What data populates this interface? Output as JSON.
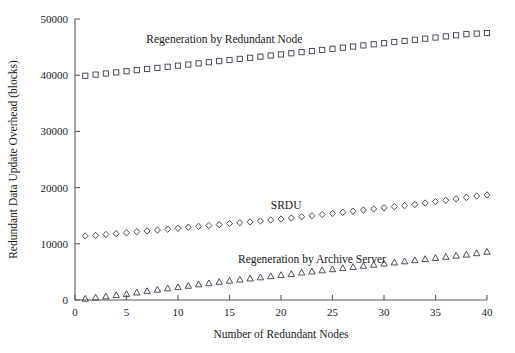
{
  "chart_data": {
    "type": "scatter",
    "title": "",
    "xlabel": "Number of Redundant Nodes",
    "ylabel": "Redundant Data Update Overhead (blocks)",
    "xlim": [
      0,
      40
    ],
    "ylim": [
      0,
      50000
    ],
    "xticks": [
      0,
      5,
      10,
      15,
      20,
      25,
      30,
      35,
      40
    ],
    "xticklabels": [
      "0",
      "5",
      "10",
      "15",
      "20",
      "25",
      "30",
      "35",
      "40"
    ],
    "yticks": [
      0,
      10000,
      20000,
      30000,
      40000,
      50000
    ],
    "yticklabels": [
      "0",
      "10000",
      "20000",
      "30000",
      "40000",
      "50000"
    ],
    "grid": false,
    "legend_position": "inline-annotations",
    "x": [
      1,
      2,
      3,
      4,
      5,
      6,
      7,
      8,
      9,
      10,
      11,
      12,
      13,
      14,
      15,
      16,
      17,
      18,
      19,
      20,
      21,
      22,
      23,
      24,
      25,
      26,
      27,
      28,
      29,
      30,
      31,
      32,
      33,
      34,
      35,
      36,
      37,
      38,
      39,
      40
    ],
    "series": [
      {
        "name": "Regeneration by Redundant Node",
        "marker": "square",
        "label_x": 14.5,
        "label_y": 45700,
        "values": [
          39900,
          40100,
          40300,
          40500,
          40700,
          40900,
          41100,
          41300,
          41500,
          41700,
          41900,
          42100,
          42300,
          42500,
          42700,
          42900,
          43100,
          43300,
          43500,
          43700,
          43900,
          44100,
          44300,
          44500,
          44700,
          44900,
          45100,
          45300,
          45500,
          45700,
          45900,
          46100,
          46300,
          46500,
          46700,
          46900,
          47100,
          47300,
          47400,
          47500
        ]
      },
      {
        "name": "SRDU",
        "marker": "diamond",
        "label_x": 20.5,
        "label_y": 16200,
        "values": [
          11400,
          11500,
          11650,
          11800,
          11950,
          12150,
          12300,
          12450,
          12600,
          12750,
          12950,
          13100,
          13250,
          13400,
          13600,
          13750,
          13900,
          14050,
          14250,
          14400,
          14600,
          14800,
          15000,
          15200,
          15400,
          15600,
          15800,
          16000,
          16200,
          16400,
          16600,
          16800,
          17000,
          17250,
          17500,
          17750,
          18000,
          18250,
          18500,
          18700
        ]
      },
      {
        "name": "Regeneration by Archive Server",
        "marker": "triangle",
        "label_x": 23.0,
        "label_y": 6600,
        "values": [
          250,
          450,
          650,
          900,
          1100,
          1350,
          1600,
          1850,
          2100,
          2300,
          2550,
          2800,
          3000,
          3250,
          3450,
          3650,
          3850,
          4050,
          4250,
          4450,
          4650,
          4900,
          5100,
          5300,
          5500,
          5700,
          5900,
          6100,
          6300,
          6500,
          6700,
          6900,
          7100,
          7300,
          7500,
          7700,
          7900,
          8100,
          8350,
          8600
        ]
      }
    ]
  },
  "colors": {
    "axis": "#5a5a5a",
    "marker": "#3b3b4a",
    "text": "#1a1a1a",
    "background": "#ffffff"
  }
}
